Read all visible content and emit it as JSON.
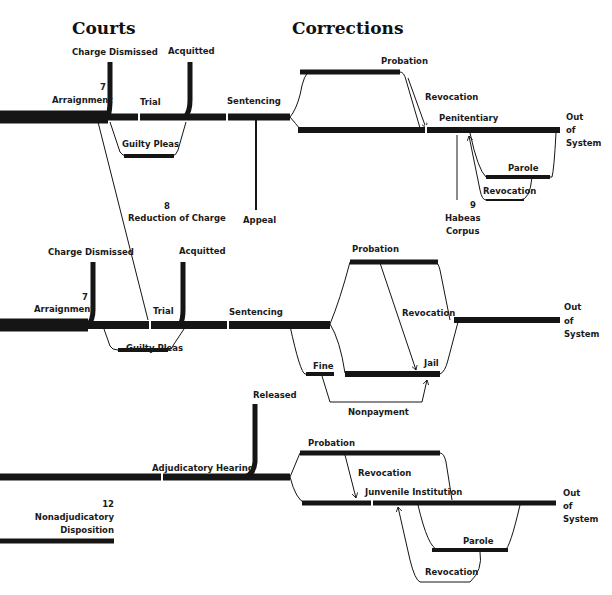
{
  "headers": {
    "courts": "Courts",
    "corrections": "Corrections"
  },
  "adult_felony": {
    "charge_dismissed": "Charge Dismissed",
    "acquitted": "Acquitted",
    "arraignment_num": "7",
    "arraignment": "Arraignment",
    "trial": "Trial",
    "guilty_pleas": "Guilty Pleas",
    "sentencing": "Sentencing",
    "appeal": "Appeal",
    "reduction_num": "8",
    "reduction": "Reduction of Charge",
    "probation": "Probation",
    "revocation1": "Revocation",
    "penitentiary": "Penitentiary",
    "parole": "Parole",
    "revocation2": "Revocation",
    "habeas_num": "9",
    "habeas1": "Habeas",
    "habeas2": "Corpus",
    "out1": "Out",
    "out2": "of",
    "out3": "System"
  },
  "misdemeanor": {
    "charge_dismissed": "Charge Dismissed",
    "acquitted": "Acquitted",
    "arraignment_num": "7",
    "arraignment": "Arraignment",
    "trial": "Trial",
    "guilty_pleas": "Guilty Pleas",
    "sentencing": "Sentencing",
    "probation": "Probation",
    "revocation": "Revocation",
    "fine": "Fine",
    "jail": "Jail",
    "nonpayment": "Nonpayment",
    "out1": "Out",
    "out2": "of",
    "out3": "System"
  },
  "juvenile": {
    "released": "Released",
    "adjudicatory_hearing": "Adjudicatory Hearing",
    "nonadj_num": "12",
    "nonadj1": "Nonadjudicatory",
    "nonadj2": "Disposition",
    "probation": "Probation",
    "revocation1": "Revocation",
    "institution": "Junvenile Institution",
    "parole": "Parole",
    "revocation2": "Revocation",
    "out1": "Out",
    "out2": "of",
    "out3": "System"
  }
}
